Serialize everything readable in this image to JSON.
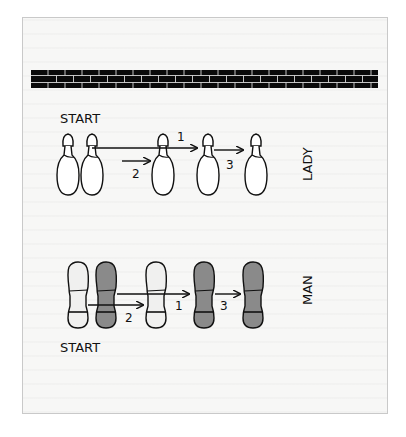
{
  "diagram": {
    "wall": {
      "label": "brick-wall",
      "color": "#000000",
      "mortar": "#d8d8d8"
    },
    "lady": {
      "row_label": "LADY",
      "start_label": "START",
      "steps": [
        {
          "number": "1"
        },
        {
          "number": "2"
        },
        {
          "number": "3"
        }
      ],
      "shoe_fill": "#ffffff"
    },
    "man": {
      "row_label": "MAN",
      "start_label": "START",
      "steps": [
        {
          "number": "1"
        },
        {
          "number": "2"
        },
        {
          "number": "3"
        }
      ],
      "shoe_fill_light": "#f0f0ef",
      "shoe_fill_dark": "#8a8a8a"
    }
  }
}
